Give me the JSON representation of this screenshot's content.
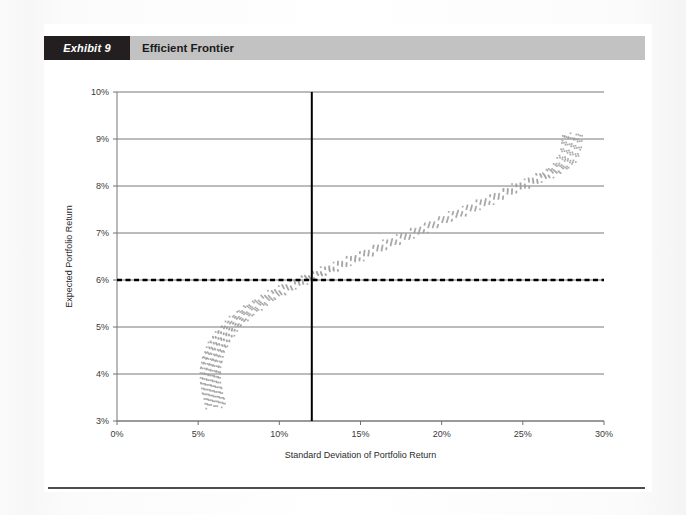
{
  "exhibit": {
    "tag": "Exhibit 9",
    "title": "Efficient Frontier"
  },
  "chart_data": {
    "type": "scatter",
    "title": "Efficient Frontier",
    "xlabel": "Standard Deviation of Portfolio Return",
    "ylabel": "Expected Portfolio Return",
    "xlim": [
      0,
      30
    ],
    "ylim": [
      3,
      10
    ],
    "x_ticks": [
      "0%",
      "5%",
      "10%",
      "15%",
      "20%",
      "25%",
      "30%"
    ],
    "x_tick_values": [
      0,
      5,
      10,
      15,
      20,
      25,
      30
    ],
    "y_ticks": [
      "3%",
      "4%",
      "5%",
      "6%",
      "7%",
      "8%",
      "9%",
      "10%"
    ],
    "y_tick_values": [
      3,
      4,
      5,
      6,
      7,
      8,
      9,
      10
    ],
    "grid": "horizontal",
    "legend_position": "below",
    "series": [
      {
        "name": "Portfolio risk and expected return",
        "type": "scatter",
        "marker": "square",
        "color": "#9b9b9b",
        "points": [
          [
            6.1,
            3.3
          ],
          [
            6.02,
            3.4
          ],
          [
            5.95,
            3.5
          ],
          [
            5.88,
            3.6
          ],
          [
            5.82,
            3.7
          ],
          [
            5.78,
            3.8
          ],
          [
            5.75,
            3.9
          ],
          [
            5.74,
            4.0
          ],
          [
            5.76,
            4.1
          ],
          [
            5.8,
            4.2
          ],
          [
            5.86,
            4.3
          ],
          [
            5.94,
            4.4
          ],
          [
            6.05,
            4.5
          ],
          [
            6.18,
            4.6
          ],
          [
            6.34,
            4.7
          ],
          [
            6.52,
            4.8
          ],
          [
            6.74,
            4.9
          ],
          [
            6.98,
            5.0
          ],
          [
            7.26,
            5.1
          ],
          [
            7.58,
            5.2
          ],
          [
            7.93,
            5.3
          ],
          [
            8.32,
            5.4
          ],
          [
            8.74,
            5.5
          ],
          [
            9.2,
            5.6
          ],
          [
            9.7,
            5.7
          ],
          [
            10.24,
            5.8
          ],
          [
            10.82,
            5.9
          ],
          [
            11.44,
            6.0
          ],
          [
            12.0,
            6.08
          ],
          [
            12.6,
            6.16
          ],
          [
            13.24,
            6.25
          ],
          [
            13.92,
            6.35
          ],
          [
            14.6,
            6.45
          ],
          [
            15.3,
            6.55
          ],
          [
            16.0,
            6.66
          ],
          [
            16.72,
            6.77
          ],
          [
            17.45,
            6.88
          ],
          [
            18.18,
            6.99
          ],
          [
            18.92,
            7.1
          ],
          [
            19.66,
            7.21
          ],
          [
            20.4,
            7.32
          ],
          [
            21.14,
            7.43
          ],
          [
            21.88,
            7.54
          ],
          [
            22.6,
            7.65
          ],
          [
            23.32,
            7.76
          ],
          [
            24.02,
            7.87
          ],
          [
            24.7,
            7.97
          ],
          [
            25.36,
            8.07
          ],
          [
            26.0,
            8.17
          ],
          [
            26.58,
            8.26
          ],
          [
            27.08,
            8.35
          ],
          [
            27.48,
            8.45
          ],
          [
            27.76,
            8.58
          ],
          [
            27.92,
            8.72
          ],
          [
            28.0,
            8.86
          ],
          [
            28.04,
            9.0
          ],
          [
            28.06,
            9.1
          ]
        ],
        "note": "Dense band of small square markers tracing the efficient frontier; minimum-variance point near 5.7% std dev at about 4.0% return, upper end near 28% std dev at about 9.1% return."
      },
      {
        "name": "Return objective",
        "type": "hline",
        "style": "dashed",
        "color": "#000000",
        "value": 6.0
      },
      {
        "name": "Risk objective",
        "type": "vline",
        "style": "solid",
        "color": "#000000",
        "value": 12.0
      }
    ],
    "annotations": [
      {
        "label": "intersection of return objective and risk objective",
        "x": 12.0,
        "y": 6.0
      }
    ]
  },
  "legend": {
    "items": [
      {
        "label": "Portfolio risk and expected return",
        "marker": "square-marker"
      },
      {
        "label": "Return objective",
        "marker": "dashed-line"
      },
      {
        "label": "Risk objective",
        "marker": "solid-line"
      }
    ]
  }
}
